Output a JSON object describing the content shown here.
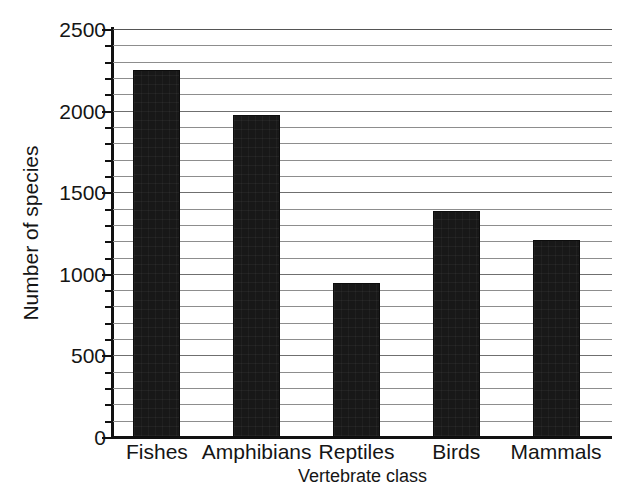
{
  "chart_data": {
    "type": "bar",
    "title": "",
    "xlabel": "Vertebrate class",
    "ylabel": "Number of species",
    "categories": [
      "Fishes",
      "Amphibians",
      "Reptiles",
      "Birds",
      "Mammals"
    ],
    "values": [
      2250,
      1975,
      945,
      1385,
      1205
    ],
    "ylim": [
      0,
      2500
    ],
    "y_major_ticks": [
      0,
      500,
      1000,
      1500,
      2000,
      2500
    ],
    "y_tick_labels": [
      "0",
      "500",
      "1000",
      "1500",
      "2000",
      "2500"
    ],
    "y_minor_tick_step": 100,
    "grid": true,
    "grid_axis": "y",
    "grid_step": 100,
    "legend": null,
    "bar_color": "#181818",
    "grid_color": "#8d8d8d",
    "axis_color": "#111111"
  },
  "axis": {
    "y_title": "Number of species",
    "x_title": "Vertebrate class"
  }
}
